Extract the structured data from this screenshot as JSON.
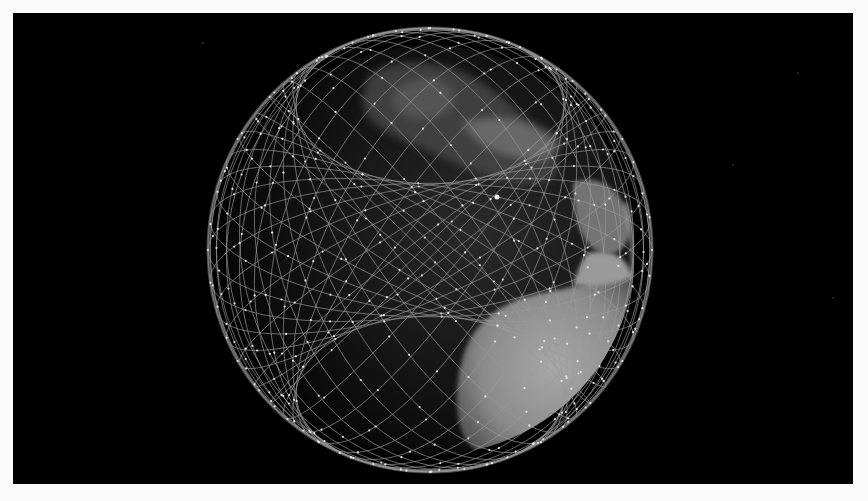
{
  "figure": {
    "background_color": "#000000",
    "orbit_line_color": "#9a9a9a",
    "satellite_dot_color": "#e6e6e6",
    "landmass_color": "#8c8c8c",
    "visible_regions": [
      "Europe",
      "Africa",
      "Arabian Peninsula"
    ],
    "orbital_planes": 36,
    "orbit_inclination_deg": 53
  },
  "caption": {
    "text": ""
  }
}
